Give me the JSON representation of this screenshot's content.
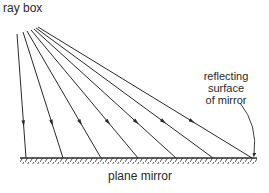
{
  "labels": {
    "ray_box": "ray box",
    "reflecting_line1": "reflecting",
    "reflecting_line2": "surface",
    "reflecting_line3": "of mirror",
    "mirror": "plane mirror"
  },
  "colors": {
    "line": "#2a2a2a",
    "background": "#ffffff"
  },
  "rays": [
    {
      "x1": 17,
      "y1": 34,
      "x2": 26,
      "y2": 158
    },
    {
      "x1": 23,
      "y1": 32,
      "x2": 63,
      "y2": 158
    },
    {
      "x1": 27,
      "y1": 31,
      "x2": 101,
      "y2": 158
    },
    {
      "x1": 31,
      "y1": 30,
      "x2": 138,
      "y2": 158
    },
    {
      "x1": 34,
      "y1": 29,
      "x2": 176,
      "y2": 158
    },
    {
      "x1": 36,
      "y1": 28,
      "x2": 213,
      "y2": 158
    },
    {
      "x1": 38,
      "y1": 27,
      "x2": 252,
      "y2": 158
    }
  ],
  "mirror": {
    "x1": 20,
    "y1": 158,
    "x2": 257,
    "y2": 158
  }
}
